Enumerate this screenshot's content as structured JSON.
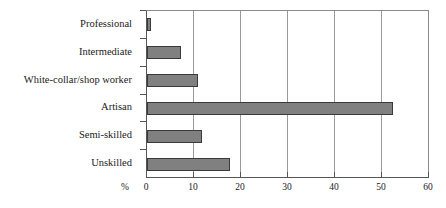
{
  "chart_data": {
    "type": "bar",
    "orientation": "horizontal",
    "title": "",
    "xlabel": "%",
    "ylabel": "",
    "categories": [
      "Professional",
      "Intermediate",
      "White-collar/shop worker",
      "Artisan",
      "Semi-skilled",
      "Unskilled"
    ],
    "values": [
      0.9,
      7.3,
      10.8,
      52.4,
      11.8,
      17.6
    ],
    "xlim": [
      0,
      60
    ],
    "xticks": [
      0,
      10,
      20,
      30,
      40,
      50,
      60
    ],
    "xtick_labels": [
      "0",
      "10",
      "20",
      "30",
      "40",
      "50",
      "60"
    ],
    "grid": "vertical",
    "legend": "none",
    "bar_color": "#808080",
    "bar_border_color": "#3a3a3a",
    "axis_color": "#555555",
    "gridline_color": "#9a9a9a",
    "background": "#ffffff"
  }
}
